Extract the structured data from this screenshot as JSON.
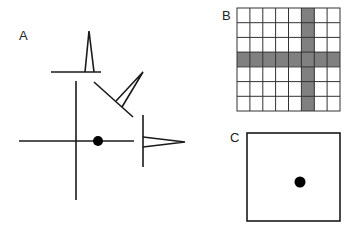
{
  "panels": {
    "a": {
      "label": "A",
      "description": "Cross-shaped axes with a dot on the horizontal axis and three projection profiles (top, diagonal, right)"
    },
    "b": {
      "label": "B",
      "description": "8x7 grid with one highlighted column and one highlighted row",
      "grid": {
        "columns": 8,
        "rows": 7,
        "highlight_column": 6,
        "highlight_row": 4
      }
    },
    "c": {
      "label": "C",
      "description": "Square frame with a single dot"
    }
  },
  "colors": {
    "stroke": "#1a1a1a",
    "shade": "#808080",
    "grid_line": "#333333",
    "dot": "#000000",
    "background": "#ffffff"
  }
}
